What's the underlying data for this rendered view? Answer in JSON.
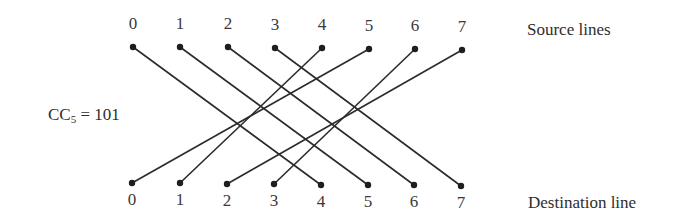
{
  "figure": {
    "control_label": {
      "prefix": "CC",
      "subscript": "5",
      "equals": " = ",
      "value": "101"
    },
    "source_label": "Source lines",
    "destination_label": "Destination line",
    "line_color": "#2b2b2b",
    "source_nodes": [
      {
        "label": "0",
        "x": 133,
        "y": 47
      },
      {
        "label": "1",
        "x": 180,
        "y": 47
      },
      {
        "label": "2",
        "x": 228,
        "y": 47
      },
      {
        "label": "3",
        "x": 275,
        "y": 48
      },
      {
        "label": "4",
        "x": 322,
        "y": 48
      },
      {
        "label": "5",
        "x": 369,
        "y": 49
      },
      {
        "label": "6",
        "x": 415,
        "y": 49
      },
      {
        "label": "7",
        "x": 462,
        "y": 50
      }
    ],
    "destination_nodes": [
      {
        "label": "0",
        "x": 132,
        "y": 183
      },
      {
        "label": "1",
        "x": 180,
        "y": 183
      },
      {
        "label": "2",
        "x": 227,
        "y": 184
      },
      {
        "label": "3",
        "x": 274,
        "y": 184
      },
      {
        "label": "4",
        "x": 321,
        "y": 185
      },
      {
        "label": "5",
        "x": 368,
        "y": 185
      },
      {
        "label": "6",
        "x": 414,
        "y": 185
      },
      {
        "label": "7",
        "x": 461,
        "y": 186
      }
    ],
    "connections": [
      {
        "from": 0,
        "to": 4
      },
      {
        "from": 1,
        "to": 5
      },
      {
        "from": 4,
        "to": 1
      },
      {
        "from": 5,
        "to": 0
      },
      {
        "from": 2,
        "to": 6
      },
      {
        "from": 3,
        "to": 7
      },
      {
        "from": 6,
        "to": 3
      },
      {
        "from": 7,
        "to": 2
      }
    ]
  }
}
